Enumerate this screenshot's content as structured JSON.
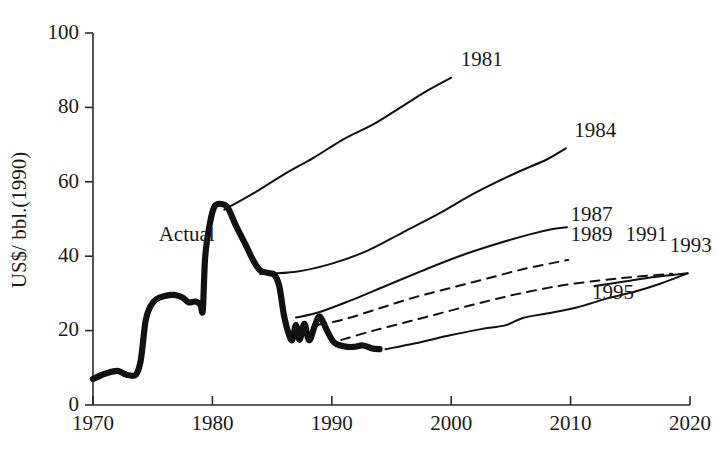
{
  "chart_data": {
    "type": "line",
    "title": "",
    "xlabel": "",
    "ylabel": "US$/ bbl.(1990)",
    "xlim": [
      1970,
      2020
    ],
    "ylim": [
      0,
      100
    ],
    "xticks": [
      "1970",
      "1980",
      "1990",
      "2000",
      "2010",
      "2020"
    ],
    "yticks": [
      "0",
      "20",
      "40",
      "60",
      "80",
      "100"
    ],
    "grid": false,
    "legend_position": "inline-end-labels",
    "annotations": [
      {
        "text": "Actual",
        "x": 1975.5,
        "y": 44
      }
    ],
    "series": [
      {
        "name": "Actual",
        "style": "solid-thick",
        "label": "Actual",
        "points": [
          [
            1970,
            7.0
          ],
          [
            1971,
            8.4
          ],
          [
            1972,
            9.2
          ],
          [
            1972.6,
            8.4
          ],
          [
            1973,
            8.0
          ],
          [
            1973.6,
            8.2
          ],
          [
            1974,
            12.0
          ],
          [
            1974.4,
            22.5
          ],
          [
            1974.8,
            26.5
          ],
          [
            1975.3,
            28.4
          ],
          [
            1976,
            29.3
          ],
          [
            1976.8,
            29.6
          ],
          [
            1977.5,
            28.9
          ],
          [
            1978,
            27.6
          ],
          [
            1978.6,
            27.8
          ],
          [
            1979,
            26.9
          ],
          [
            1979.2,
            25.6
          ],
          [
            1979.4,
            40.0
          ],
          [
            1979.8,
            49.0
          ],
          [
            1980.2,
            53.5
          ],
          [
            1980.8,
            54.0
          ],
          [
            1981.3,
            53.0
          ],
          [
            1982,
            48.0
          ],
          [
            1982.8,
            43.0
          ],
          [
            1983.4,
            39.0
          ],
          [
            1984,
            36.2
          ],
          [
            1984.8,
            35.4
          ],
          [
            1985.2,
            35.0
          ],
          [
            1985.6,
            32.0
          ],
          [
            1986,
            24.0
          ],
          [
            1986.4,
            19.0
          ],
          [
            1986.7,
            17.5
          ],
          [
            1987,
            21.5
          ],
          [
            1987.3,
            17.5
          ],
          [
            1987.7,
            21.8
          ],
          [
            1988.1,
            17.4
          ],
          [
            1988.6,
            21.5
          ],
          [
            1989,
            23.8
          ],
          [
            1989.6,
            20.0
          ],
          [
            1990.2,
            16.8
          ],
          [
            1991,
            15.8
          ],
          [
            1991.8,
            15.6
          ],
          [
            1992.6,
            16.0
          ],
          [
            1993.4,
            15.2
          ],
          [
            1994,
            15.0
          ]
        ]
      },
      {
        "name": "1981",
        "style": "solid",
        "label": "1981",
        "label_pos": [
          2000.8,
          91
        ],
        "points": [
          [
            1981.0,
            52.5
          ],
          [
            1983.5,
            57.0
          ],
          [
            1986.0,
            62.0
          ],
          [
            1988.5,
            66.5
          ],
          [
            1991.0,
            71.5
          ],
          [
            1993.5,
            75.5
          ],
          [
            1996.0,
            80.5
          ],
          [
            1998.0,
            84.5
          ],
          [
            2000.0,
            88.0
          ]
        ]
      },
      {
        "name": "1984",
        "style": "solid",
        "label": "1984",
        "label_pos": [
          2010.3,
          72
        ],
        "points": [
          [
            1984.0,
            35.2
          ],
          [
            1987.0,
            35.8
          ],
          [
            1990.0,
            38.0
          ],
          [
            1993.0,
            41.5
          ],
          [
            1996.0,
            46.5
          ],
          [
            1999.0,
            51.5
          ],
          [
            2002.0,
            57.0
          ],
          [
            2005.5,
            62.5
          ],
          [
            2008.0,
            66.0
          ],
          [
            2009.6,
            69.0
          ]
        ]
      },
      {
        "name": "1987",
        "style": "solid",
        "label": "1987",
        "label_pos": [
          2010.0,
          49.5
        ],
        "points": [
          [
            1987.0,
            23.5
          ],
          [
            1989.0,
            25.0
          ],
          [
            1991.5,
            28.0
          ],
          [
            1994.5,
            32.0
          ],
          [
            1997.5,
            36.0
          ],
          [
            2000.5,
            39.8
          ],
          [
            2003.5,
            43.0
          ],
          [
            2006.5,
            45.8
          ],
          [
            2008.5,
            47.3
          ],
          [
            2009.7,
            47.8
          ]
        ]
      },
      {
        "name": "1989",
        "style": "dashed",
        "label": "1989",
        "label_pos": [
          2010.0,
          44.0
        ],
        "points": [
          [
            1988.8,
            21.5
          ],
          [
            1991.0,
            23.0
          ],
          [
            1994.0,
            26.0
          ],
          [
            1997.0,
            29.0
          ],
          [
            2000.0,
            31.5
          ],
          [
            2003.0,
            34.0
          ],
          [
            2006.0,
            36.5
          ],
          [
            2009.0,
            38.5
          ],
          [
            2009.8,
            39.0
          ]
        ]
      },
      {
        "name": "1991",
        "style": "dashed",
        "label": "1991",
        "label_pos": [
          2014.6,
          44.0
        ],
        "points": [
          [
            1990.8,
            17.5
          ],
          [
            1993.5,
            20.0
          ],
          [
            1996.5,
            22.5
          ],
          [
            1999.5,
            25.0
          ],
          [
            2002.5,
            27.5
          ],
          [
            2005.5,
            29.8
          ],
          [
            2009.0,
            32.0
          ],
          [
            2012.5,
            33.5
          ],
          [
            2015.5,
            34.5
          ],
          [
            2018.5,
            35.3
          ]
        ]
      },
      {
        "name": "1993",
        "style": "solid",
        "label": "1993",
        "label_pos": [
          2018.3,
          41.0
        ],
        "points": [
          [
            2012.0,
            32.0
          ],
          [
            2014.5,
            33.2
          ],
          [
            2017.0,
            34.4
          ],
          [
            2019.8,
            35.4
          ]
        ]
      },
      {
        "name": "1995",
        "style": "solid",
        "label": "1995",
        "label_pos": [
          2011.8,
          28.5
        ],
        "points": [
          [
            1994.5,
            15.0
          ],
          [
            1997.0,
            16.6
          ],
          [
            2000.0,
            18.8
          ],
          [
            2002.5,
            20.4
          ],
          [
            2004.5,
            21.4
          ],
          [
            2006.0,
            23.4
          ],
          [
            2008.0,
            24.6
          ],
          [
            2010.5,
            26.2
          ],
          [
            2013.0,
            28.6
          ],
          [
            2015.5,
            30.6
          ],
          [
            2017.5,
            32.6
          ],
          [
            2019.8,
            35.4
          ]
        ]
      }
    ]
  },
  "colors": {
    "ink": "#111111",
    "axis": "#2b2b2b",
    "background": "#ffffff"
  }
}
